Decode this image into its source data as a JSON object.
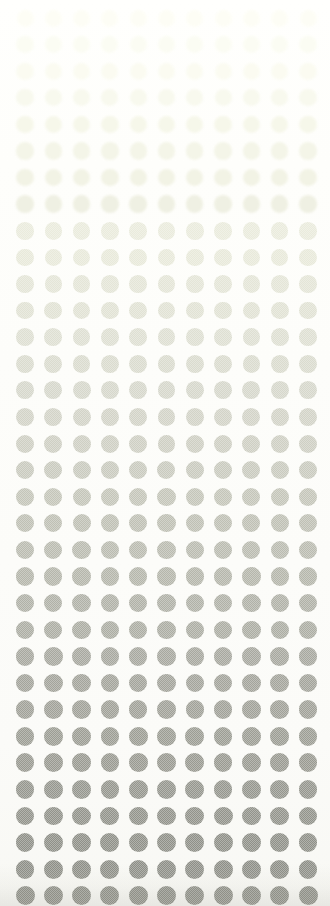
{
  "artwork": {
    "title": "Halftone Dot Gradient",
    "kind": "abstract-pattern",
    "width": 330,
    "height": 906,
    "background_color": "#fefefc",
    "description": "A regular grid of soft-edged circular halftone dots that fade from nearly invisible pale cream at the top of the frame to a medium warm gray at the bottom."
  },
  "grid": {
    "columns": 11,
    "rows": 34,
    "column_pitch": 28.3,
    "row_pitch": 26.6,
    "first_column_center_x": 25,
    "first_row_center_y": 18,
    "dot_diameter": 17,
    "dot_diameter_bottom": 19,
    "texture": "halftone-checker"
  },
  "gradient": {
    "direction": "top-to-bottom",
    "stops": [
      {
        "position": 0.0,
        "color": "#fdfdf4"
      },
      {
        "position": 0.06,
        "color": "#fafbef"
      },
      {
        "position": 0.12,
        "color": "#f5f6e7"
      },
      {
        "position": 0.2,
        "color": "#eeefdf"
      },
      {
        "position": 0.28,
        "color": "#e7e8d9"
      },
      {
        "position": 0.36,
        "color": "#dedfd2"
      },
      {
        "position": 0.45,
        "color": "#d3d4c8"
      },
      {
        "position": 0.54,
        "color": "#c5c6ba"
      },
      {
        "position": 0.63,
        "color": "#b6b7ac"
      },
      {
        "position": 0.72,
        "color": "#a8a9a0"
      },
      {
        "position": 0.82,
        "color": "#9c9d94"
      },
      {
        "position": 0.91,
        "color": "#92938b"
      },
      {
        "position": 1.0,
        "color": "#8a8b83"
      }
    ]
  }
}
